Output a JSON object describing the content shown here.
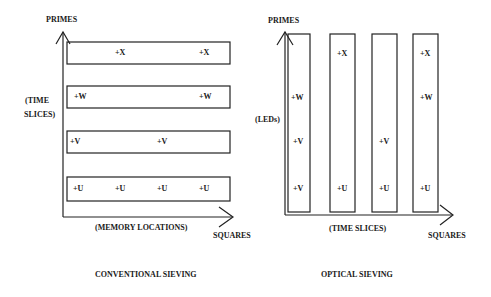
{
  "left_panel": {
    "caption": "CONVENTIONAL SIEVING",
    "y_axis_label": "PRIMES",
    "y_axis_sublabel_line1": "(TIME",
    "y_axis_sublabel_line2": "SLICES)",
    "x_axis_label": "SQUARES",
    "x_axis_sublabel": "(MEMORY LOCATIONS)",
    "rows": [
      {
        "name": "X",
        "marks": [
          {
            "text": "+X",
            "x": 120
          },
          {
            "text": "+X",
            "x": 200
          }
        ]
      },
      {
        "name": "W",
        "marks": [
          {
            "text": "+W",
            "x": 72
          },
          {
            "text": "+W",
            "x": 200
          }
        ]
      },
      {
        "name": "V",
        "marks": [
          {
            "text": "+V",
            "x": 70
          },
          {
            "text": "+V",
            "x": 158
          }
        ]
      },
      {
        "name": "U",
        "marks": [
          {
            "text": "+U",
            "x": 74
          },
          {
            "text": "+U",
            "x": 116
          },
          {
            "text": "+U",
            "x": 158
          },
          {
            "text": "+U",
            "x": 200
          }
        ]
      }
    ]
  },
  "right_panel": {
    "caption": "OPTICAL SIEVING",
    "y_axis_label": "PRIMES",
    "y_axis_sublabel": "(LEDs)",
    "x_axis_label": "SQUARES",
    "x_axis_sublabel": "(TIME SLICES)",
    "columns": [
      {
        "marks": [
          {
            "text": "+W",
            "y": 98
          },
          {
            "text": "+V",
            "y": 143
          },
          {
            "text": "+V",
            "y": 190
          }
        ]
      },
      {
        "marks": [
          {
            "text": "+X",
            "y": 55
          },
          {
            "text": "+U",
            "y": 190
          }
        ]
      },
      {
        "marks": [
          {
            "text": "+V",
            "y": 143
          },
          {
            "text": "+U",
            "y": 190
          }
        ]
      },
      {
        "marks": [
          {
            "text": "+X",
            "y": 55
          },
          {
            "text": "+W",
            "y": 98
          },
          {
            "text": "+U",
            "y": 190
          }
        ]
      }
    ]
  }
}
